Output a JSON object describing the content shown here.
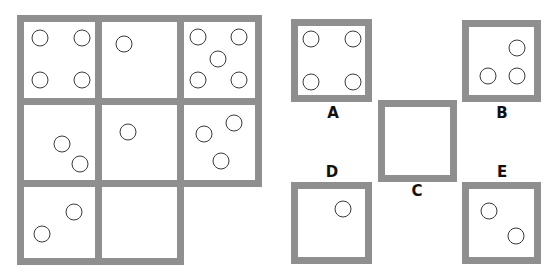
{
  "colors": {
    "border": "#8f8f8f",
    "circle_stroke": "#3a3a3a",
    "label": "#111111",
    "background": "#ffffff"
  },
  "puzzle_grid": {
    "cells": [
      {
        "row": 0,
        "col": 0,
        "x": 17,
        "y": 15,
        "w": 85,
        "h": 90,
        "circles": [
          [
            40,
            38
          ],
          [
            82,
            38
          ],
          [
            40,
            80
          ],
          [
            82,
            80
          ]
        ]
      },
      {
        "row": 0,
        "col": 1,
        "x": 95,
        "y": 15,
        "w": 89,
        "h": 90,
        "circles": [
          [
            124,
            44
          ]
        ]
      },
      {
        "row": 0,
        "col": 2,
        "x": 177,
        "y": 15,
        "w": 85,
        "h": 90,
        "circles": [
          [
            198,
            37
          ],
          [
            239,
            37
          ],
          [
            218,
            59
          ],
          [
            198,
            80
          ],
          [
            239,
            80
          ]
        ]
      },
      {
        "row": 1,
        "col": 0,
        "x": 17,
        "y": 98,
        "w": 85,
        "h": 89,
        "circles": [
          [
            62,
            144
          ],
          [
            80,
            164
          ]
        ]
      },
      {
        "row": 1,
        "col": 1,
        "x": 95,
        "y": 98,
        "w": 89,
        "h": 89,
        "circles": [
          [
            128,
            132
          ]
        ]
      },
      {
        "row": 1,
        "col": 2,
        "x": 177,
        "y": 98,
        "w": 85,
        "h": 89,
        "circles": [
          [
            204,
            134
          ],
          [
            234,
            123
          ],
          [
            221,
            161
          ]
        ]
      },
      {
        "row": 2,
        "col": 0,
        "x": 17,
        "y": 180,
        "w": 85,
        "h": 85,
        "circles": [
          [
            74,
            212
          ],
          [
            42,
            234
          ]
        ]
      },
      {
        "row": 2,
        "col": 1,
        "x": 95,
        "y": 180,
        "w": 89,
        "h": 85,
        "circles": [],
        "missing": true
      }
    ]
  },
  "options": [
    {
      "label": "A",
      "box": {
        "x": 291,
        "y": 19,
        "w": 81,
        "h": 83
      },
      "label_pos": [
        333,
        113
      ],
      "circles": [
        [
          311,
          39
        ],
        [
          353,
          39
        ],
        [
          311,
          82
        ],
        [
          353,
          82
        ]
      ]
    },
    {
      "label": "B",
      "box": {
        "x": 462,
        "y": 20,
        "w": 79,
        "h": 82
      },
      "label_pos": [
        502,
        113
      ],
      "circles": [
        [
          517,
          48
        ],
        [
          488,
          76
        ],
        [
          517,
          76
        ]
      ]
    },
    {
      "label": "C",
      "box": {
        "x": 378,
        "y": 100,
        "w": 79,
        "h": 82
      },
      "label_pos": [
        417,
        191
      ],
      "circles": []
    },
    {
      "label": "D",
      "box": {
        "x": 291,
        "y": 182,
        "w": 81,
        "h": 82
      },
      "label_pos": [
        332,
        172
      ],
      "circles": [
        [
          343,
          209
        ]
      ]
    },
    {
      "label": "E",
      "box": {
        "x": 462,
        "y": 182,
        "w": 79,
        "h": 82
      },
      "label_pos": [
        502,
        172
      ],
      "circles": [
        [
          489,
          211
        ],
        [
          516,
          236
        ]
      ]
    }
  ]
}
